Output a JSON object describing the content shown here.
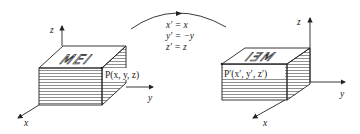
{
  "diagram": {
    "type": "reflection-transformation",
    "left": {
      "axes": {
        "z": "z",
        "y": "y",
        "x": "x"
      },
      "box_top_text": "MEI",
      "point_label": "P(x, y, z)"
    },
    "arrow_equations": [
      "x′ = x",
      "y′ = −y",
      "z′ = z"
    ],
    "right": {
      "axes": {
        "z": "z",
        "y": "y",
        "x": "x"
      },
      "box_top_text": "IƎM",
      "point_label": "P′(x′, y′, z′)"
    },
    "colors": {
      "ink": "#222222",
      "background": "#ffffff"
    }
  }
}
